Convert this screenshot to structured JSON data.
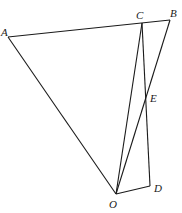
{
  "diagram": {
    "points": {
      "A": {
        "label": "A",
        "x": 8,
        "y": 37,
        "lx": 1,
        "ly": 36
      },
      "B": {
        "label": "B",
        "x": 170,
        "y": 20,
        "lx": 170,
        "ly": 17
      },
      "C": {
        "label": "C",
        "x": 142,
        "y": 23,
        "lx": 136,
        "ly": 19
      },
      "D": {
        "label": "D",
        "x": 150,
        "y": 186,
        "lx": 154,
        "ly": 192
      },
      "E": {
        "label": "E",
        "x": 146,
        "y": 97,
        "lx": 150,
        "ly": 102
      },
      "O": {
        "label": "O",
        "x": 116,
        "y": 194,
        "lx": 109,
        "ly": 208
      }
    },
    "segments": [
      [
        "A",
        "B"
      ],
      [
        "A",
        "O"
      ],
      [
        "C",
        "O"
      ],
      [
        "B",
        "O"
      ],
      [
        "C",
        "D"
      ],
      [
        "O",
        "D"
      ]
    ]
  }
}
